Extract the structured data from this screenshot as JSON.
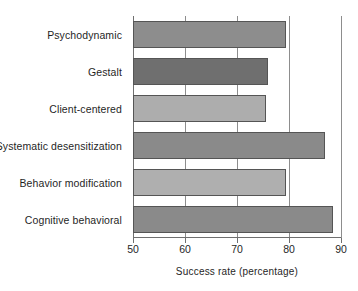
{
  "chart_data": {
    "type": "bar",
    "orientation": "horizontal",
    "title": "",
    "xlabel": "Success rate (percentage)",
    "ylabel": "",
    "xlim": [
      50,
      90
    ],
    "xticks": [
      50,
      60,
      70,
      80,
      90
    ],
    "xtick_labels": [
      "50",
      "60",
      "70",
      "80",
      "90"
    ],
    "grid": "vertical gridlines at 60, 70, 80, 90",
    "legend": "none",
    "categories": [
      "Psychodynamic",
      "Gestalt",
      "Client-centered",
      "Systematic desensitization",
      "Behavior modification",
      "Cognitive behavioral"
    ],
    "values": [
      79.5,
      76,
      75.5,
      87,
      79.5,
      88.5
    ],
    "bar_colors": [
      "#8d8d8d",
      "#6f6f6f",
      "#adadad",
      "#8a8a8a",
      "#afafaf",
      "#8a8a8a"
    ],
    "bar_edge_color": "#555555",
    "axis_color": "#6f6f6f",
    "gridline_color": "#8d8d8d",
    "background": "#ffffff"
  }
}
